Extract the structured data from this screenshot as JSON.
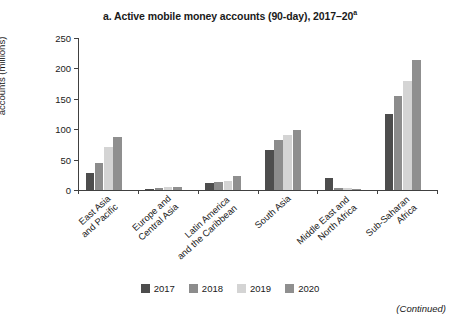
{
  "title": {
    "text": "a. Active mobile money accounts (90-day), 2017–20",
    "superscript": "a"
  },
  "footer": {
    "continued_label": "(Continued)"
  },
  "chart_data": {
    "type": "bar",
    "title": "a. Active mobile money accounts (90-day), 2017–20a",
    "xlabel": "",
    "ylabel": "Number of active mobile money accounts (millions)",
    "ylim": [
      0,
      250
    ],
    "yticks": [
      0,
      50,
      100,
      150,
      200,
      250
    ],
    "ytick_labels": [
      "0",
      "50",
      "100",
      "150",
      "200",
      "250"
    ],
    "grid": false,
    "legend_position": "bottom",
    "categories": [
      "East Asia and Pacific",
      "Europe and Central Asia",
      "Latin America and the Caribbean",
      "South Asia",
      "Middle East and North Africa",
      "Sub-Saharan Africa"
    ],
    "category_lines": [
      [
        "East Asia",
        "and Pacific"
      ],
      [
        "Europe and",
        "Central Asia"
      ],
      [
        "Latin America",
        "and the Caribbean"
      ],
      [
        "South Asia"
      ],
      [
        "Middle East and",
        "North Africa"
      ],
      [
        "Sub-Saharan",
        "Africa"
      ]
    ],
    "series": [
      {
        "name": "2017",
        "color": "#4d4d4d",
        "values": [
          28,
          2,
          12,
          65,
          20,
          125
        ]
      },
      {
        "name": "2018",
        "color": "#8c8c8c",
        "values": [
          45,
          4,
          14,
          83,
          3,
          155
        ]
      },
      {
        "name": "2019",
        "color": "#d4d4d4",
        "values": [
          70,
          5,
          15,
          90,
          3,
          180
        ]
      },
      {
        "name": "2020",
        "color": "#8f8f8f",
        "values": [
          87,
          5,
          23,
          98,
          2,
          214
        ]
      }
    ]
  }
}
